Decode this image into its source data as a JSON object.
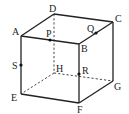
{
  "diagram": {
    "type": "cube",
    "vertices": {
      "A": {
        "x": 21,
        "y": 36,
        "lx": 12,
        "ly": 35
      },
      "B": {
        "x": 79,
        "y": 44,
        "lx": 81,
        "ly": 52
      },
      "C": {
        "x": 113,
        "y": 22,
        "lx": 115,
        "ly": 22
      },
      "D": {
        "x": 54,
        "y": 14,
        "lx": 49,
        "ly": 12
      },
      "E": {
        "x": 21,
        "y": 94,
        "lx": 11,
        "ly": 101
      },
      "F": {
        "x": 79,
        "y": 103,
        "lx": 77,
        "ly": 113
      },
      "G": {
        "x": 113,
        "y": 81,
        "lx": 114,
        "ly": 90
      },
      "H": {
        "x": 54,
        "y": 73,
        "lx": 56,
        "ly": 72
      }
    },
    "points": {
      "P": {
        "x": 50,
        "y": 40,
        "lx": 46,
        "ly": 37,
        "on": "AB"
      },
      "Q": {
        "x": 96,
        "y": 33,
        "lx": 87,
        "ly": 32,
        "on": "BC"
      },
      "R": {
        "x": 79,
        "y": 74,
        "lx": 82,
        "ly": 74,
        "on": "BF"
      },
      "S": {
        "x": 21,
        "y": 65,
        "lx": 12,
        "ly": 69,
        "on": "AE"
      }
    },
    "visible_edges": [
      "AB",
      "BC",
      "CD",
      "DA",
      "AE",
      "BF",
      "CG",
      "EF",
      "FG"
    ],
    "hidden_edges": [
      "DH",
      "HE",
      "HG"
    ],
    "labels": {
      "A": "A",
      "B": "B",
      "C": "C",
      "D": "D",
      "E": "E",
      "F": "F",
      "G": "G",
      "H": "H",
      "P": "P",
      "Q": "Q",
      "R": "R",
      "S": "S"
    }
  }
}
